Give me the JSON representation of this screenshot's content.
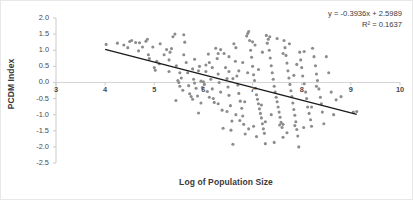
{
  "chart_data": {
    "type": "scatter",
    "title": "",
    "xlabel": "Log of Population Size",
    "ylabel": "PCDM Index",
    "xlim": [
      3,
      10
    ],
    "ylim": [
      -2.5,
      2.0
    ],
    "xticks": [
      "3",
      "4",
      "5",
      "6",
      "7",
      "8",
      "9",
      "10"
    ],
    "yticks": [
      "2.0",
      "1.5",
      "1.0",
      "0.5",
      "0.0",
      "-0.5",
      "-1.0",
      "-1.5",
      "-2.0",
      "-2.5"
    ],
    "grid": false,
    "legend": "none",
    "annotations": {
      "equation": "y = -0.3936x + 2.5989",
      "r_squared": "R² = 0.1637"
    },
    "trendline": {
      "slope": -0.3936,
      "intercept": 2.5989,
      "x_start": 4.0,
      "x_end": 9.12,
      "color": "#1a1a1a"
    },
    "marker": {
      "shape": "circle",
      "color": "#8c8c8c",
      "size_px": 3.1
    },
    "points": [
      [
        4.02,
        1.18
      ],
      [
        4.25,
        1.22
      ],
      [
        4.38,
        1.16
      ],
      [
        4.5,
        1.27
      ],
      [
        4.54,
        1.3
      ],
      [
        4.62,
        1.24
      ],
      [
        4.7,
        1.23
      ],
      [
        4.76,
        1.1
      ],
      [
        4.83,
        1.28
      ],
      [
        4.86,
        1.34
      ],
      [
        4.88,
        0.86
      ],
      [
        4.9,
        0.74
      ],
      [
        4.97,
        1.1
      ],
      [
        5.0,
        0.46
      ],
      [
        5.02,
        0.38
      ],
      [
        5.05,
        0.66
      ],
      [
        5.1,
        0.58
      ],
      [
        5.2,
        0.86
      ],
      [
        5.25,
        1.02
      ],
      [
        5.3,
        0.7
      ],
      [
        5.32,
        0.94
      ],
      [
        5.35,
        1.05
      ],
      [
        5.38,
        1.42
      ],
      [
        5.42,
        1.5
      ],
      [
        5.45,
        0.52
      ],
      [
        5.48,
        0.06
      ],
      [
        5.5,
        0.0
      ],
      [
        5.52,
        -0.12
      ],
      [
        5.55,
        0.14
      ],
      [
        5.58,
        -0.24
      ],
      [
        5.6,
        1.48
      ],
      [
        5.62,
        1.25
      ],
      [
        5.65,
        0.62
      ],
      [
        5.68,
        0.3
      ],
      [
        5.7,
        -0.1
      ],
      [
        5.72,
        -0.35
      ],
      [
        5.75,
        -0.44
      ],
      [
        5.78,
        0.42
      ],
      [
        5.8,
        0.1
      ],
      [
        5.82,
        -0.02
      ],
      [
        5.85,
        -0.18
      ],
      [
        5.88,
        -0.42
      ],
      [
        5.9,
        -0.95
      ],
      [
        5.92,
        0.5
      ],
      [
        5.95,
        0.04
      ],
      [
        5.98,
        -0.16
      ],
      [
        6.0,
        0.02
      ],
      [
        6.02,
        -0.06
      ],
      [
        6.05,
        0.34
      ],
      [
        6.08,
        -0.28
      ],
      [
        6.1,
        0.88
      ],
      [
        6.12,
        0.62
      ],
      [
        6.15,
        0.1
      ],
      [
        6.18,
        -0.2
      ],
      [
        6.2,
        -0.5
      ],
      [
        6.22,
        -0.62
      ],
      [
        6.25,
        1.06
      ],
      [
        6.28,
        0.74
      ],
      [
        6.3,
        0.26
      ],
      [
        6.32,
        0.0
      ],
      [
        6.35,
        -0.3
      ],
      [
        6.38,
        -0.86
      ],
      [
        6.4,
        -1.42
      ],
      [
        6.42,
        0.9
      ],
      [
        6.45,
        0.46
      ],
      [
        6.48,
        0.12
      ],
      [
        6.5,
        -0.14
      ],
      [
        6.52,
        -0.4
      ],
      [
        6.55,
        -0.72
      ],
      [
        6.58,
        -1.2
      ],
      [
        6.6,
        -1.92
      ],
      [
        6.62,
        1.2
      ],
      [
        6.65,
        0.66
      ],
      [
        6.68,
        0.2
      ],
      [
        6.7,
        -0.08
      ],
      [
        6.72,
        -0.34
      ],
      [
        6.75,
        -0.58
      ],
      [
        6.78,
        -0.8
      ],
      [
        6.8,
        -1.04
      ],
      [
        6.82,
        -1.3
      ],
      [
        6.85,
        -1.6
      ],
      [
        6.88,
        1.44
      ],
      [
        6.9,
        1.52
      ],
      [
        6.92,
        1.58
      ],
      [
        6.94,
        1.3
      ],
      [
        6.96,
        1.0
      ],
      [
        6.98,
        0.78
      ],
      [
        7.0,
        0.5
      ],
      [
        7.02,
        0.24
      ],
      [
        7.04,
        0.06
      ],
      [
        7.06,
        -0.18
      ],
      [
        7.08,
        -0.38
      ],
      [
        7.1,
        -0.52
      ],
      [
        7.12,
        -0.66
      ],
      [
        7.14,
        -0.82
      ],
      [
        7.16,
        -0.96
      ],
      [
        7.18,
        -1.1
      ],
      [
        7.2,
        -1.28
      ],
      [
        7.22,
        -1.44
      ],
      [
        7.24,
        -1.58
      ],
      [
        7.26,
        -1.9
      ],
      [
        7.28,
        1.46
      ],
      [
        7.3,
        1.22
      ],
      [
        7.32,
        1.34
      ],
      [
        7.34,
        1.0
      ],
      [
        7.36,
        0.76
      ],
      [
        7.38,
        0.52
      ],
      [
        7.4,
        0.3
      ],
      [
        7.42,
        0.1
      ],
      [
        7.44,
        -0.12
      ],
      [
        7.46,
        -0.3
      ],
      [
        7.48,
        -0.46
      ],
      [
        7.5,
        -0.6
      ],
      [
        7.52,
        -0.76
      ],
      [
        7.54,
        -0.92
      ],
      [
        7.56,
        -1.08
      ],
      [
        7.58,
        -1.24
      ],
      [
        7.6,
        -1.4
      ],
      [
        7.62,
        -1.7
      ],
      [
        7.64,
        1.3
      ],
      [
        7.66,
        1.08
      ],
      [
        7.68,
        0.84
      ],
      [
        7.7,
        0.6
      ],
      [
        7.72,
        0.36
      ],
      [
        7.74,
        0.14
      ],
      [
        7.76,
        -0.06
      ],
      [
        7.78,
        -0.26
      ],
      [
        7.8,
        -0.44
      ],
      [
        7.82,
        -0.64
      ],
      [
        7.84,
        -0.84
      ],
      [
        7.86,
        -1.02
      ],
      [
        7.88,
        -1.22
      ],
      [
        7.9,
        -1.46
      ],
      [
        7.92,
        -1.66
      ],
      [
        7.94,
        -2.0
      ],
      [
        7.96,
        0.94
      ],
      [
        7.98,
        0.7
      ],
      [
        8.0,
        0.46
      ],
      [
        8.02,
        0.2
      ],
      [
        8.05,
        -0.04
      ],
      [
        8.08,
        -0.3
      ],
      [
        8.1,
        -0.5
      ],
      [
        8.12,
        -0.76
      ],
      [
        8.15,
        -0.96
      ],
      [
        8.18,
        -1.16
      ],
      [
        8.2,
        -1.36
      ],
      [
        8.22,
        1.06
      ],
      [
        8.25,
        0.8
      ],
      [
        8.28,
        0.52
      ],
      [
        8.3,
        0.26
      ],
      [
        8.32,
        0.06
      ],
      [
        8.35,
        -0.2
      ],
      [
        8.38,
        -0.46
      ],
      [
        8.4,
        -0.66
      ],
      [
        8.42,
        -0.92
      ],
      [
        8.45,
        -1.28
      ],
      [
        8.5,
        0.8
      ],
      [
        8.55,
        0.3
      ],
      [
        8.6,
        -0.3
      ],
      [
        8.65,
        -1.0
      ],
      [
        8.7,
        -0.54
      ],
      [
        8.8,
        -0.44
      ],
      [
        9.05,
        -0.92
      ],
      [
        9.12,
        -0.9
      ],
      [
        5.44,
        -0.56
      ],
      [
        5.9,
        0.36
      ],
      [
        6.05,
        0.54
      ],
      [
        6.3,
        0.9
      ],
      [
        6.52,
        0.34
      ],
      [
        6.72,
        0.36
      ],
      [
        6.9,
        0.3
      ],
      [
        7.05,
        1.16
      ],
      [
        7.2,
        0.94
      ],
      [
        7.35,
        1.42
      ],
      [
        7.5,
        1.36
      ],
      [
        7.62,
        0.9
      ],
      [
        7.75,
        1.2
      ],
      [
        7.9,
        0.56
      ],
      [
        8.05,
        0.96
      ],
      [
        6.35,
        1.02
      ],
      [
        6.52,
        0.8
      ],
      [
        6.66,
        1.08
      ],
      [
        6.8,
        0.62
      ],
      [
        7.0,
        1.26
      ],
      [
        5.6,
        0.86
      ],
      [
        5.82,
        0.72
      ],
      [
        6.12,
        -0.46
      ],
      [
        6.3,
        -0.66
      ],
      [
        6.48,
        -0.9
      ],
      [
        6.66,
        -1.0
      ],
      [
        6.84,
        -0.6
      ],
      [
        7.02,
        -1.36
      ],
      [
        7.18,
        -0.7
      ],
      [
        7.38,
        -1.0
      ],
      [
        7.55,
        -1.32
      ],
      [
        7.7,
        -1.56
      ],
      [
        7.86,
        -1.34
      ],
      [
        8.04,
        -1.4
      ],
      [
        8.2,
        -0.76
      ],
      [
        6.92,
        -1.44
      ],
      [
        7.08,
        -1.68
      ],
      [
        7.26,
        -1.22
      ],
      [
        7.44,
        -1.86
      ],
      [
        7.62,
        -1.3
      ],
      [
        6.56,
        -1.48
      ],
      [
        6.74,
        -1.18
      ],
      [
        5.95,
        -0.64
      ],
      [
        5.78,
        -0.52
      ],
      [
        6.18,
        0.46
      ],
      [
        6.6,
        0.12
      ],
      [
        7.12,
        0.4
      ],
      [
        7.84,
        0.22
      ],
      [
        8.3,
        -0.12
      ],
      [
        4.46,
        1.08
      ],
      [
        4.68,
        0.98
      ],
      [
        5.12,
        1.2
      ],
      [
        5.3,
        0.34
      ],
      [
        5.52,
        0.3
      ]
    ]
  }
}
